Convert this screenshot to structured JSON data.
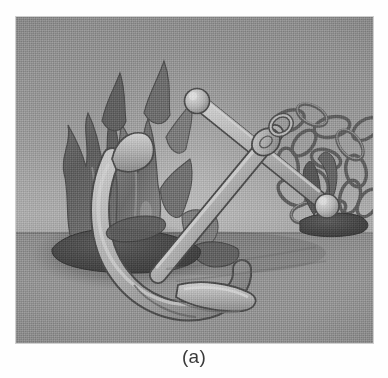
{
  "figure": {
    "caption": "(a)",
    "alt_description": "Grayscale halftone photograph of a ship's anchor sculpture resting on a flat ground plane, flanked by a dark flame-like coral form on the left and a tangled chain on the right.",
    "plate": {
      "left": 16,
      "top": 17,
      "width": 357,
      "height": 326,
      "horizon_fraction": 0.66
    },
    "palette": {
      "page_background": "#ffffff",
      "sky_top": "#8d8d8d",
      "sky_bottom": "#acacac",
      "ground_top": "#8a8a8a",
      "ground_bottom": "#8f8f8f",
      "horizon_line": "#787878",
      "anchor_light": "#c9c9c9",
      "anchor_mid": "#a8a8a8",
      "anchor_shadow": "#6e6e6e",
      "outline": "#4c4c4c",
      "flame_dark": "#5e5e5e",
      "flame_mid": "#747474",
      "base_rock": "#4a4a4a",
      "chain_stroke": "#5a5a5a",
      "caption_text": "#3a3a3a"
    },
    "objects": [
      {
        "name": "anchor",
        "label": "ship anchor",
        "parts": [
          "ball-end",
          "stock",
          "shank",
          "crown",
          "arms",
          "flukes"
        ]
      },
      {
        "name": "flame-coral",
        "label": "flame-like coral form",
        "position": "left"
      },
      {
        "name": "chain",
        "label": "tangled chain coil",
        "position": "right"
      },
      {
        "name": "rock-base-left",
        "label": "dark rock base",
        "position": "left-bottom"
      },
      {
        "name": "rock-base-right",
        "label": "dark rock base",
        "position": "right-bottom"
      },
      {
        "name": "cast-shadow",
        "label": "cast shadow on ground",
        "position": "center-left"
      }
    ]
  }
}
